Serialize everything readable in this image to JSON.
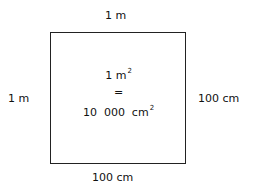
{
  "labels": {
    "top": "1 m",
    "left": "1 m",
    "right": "100  cm",
    "bottom": "100  cm"
  },
  "center": {
    "line1_value": "1 m",
    "line1_exp": "2",
    "equals": "=",
    "line2_value": "10  000  cm",
    "line2_exp": "2"
  }
}
